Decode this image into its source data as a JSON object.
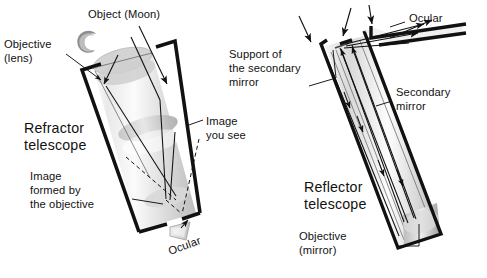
{
  "figure": {
    "title_visible": false,
    "background_color": "#ffffff",
    "ink_color": "#111111",
    "tube_fill_light": "#f2f2f2",
    "tube_fill_mid": "#c9c9c9",
    "tube_fill_dark": "#9a9a9a"
  },
  "refractor": {
    "name_line1": "Refractor",
    "name_line2": "telescope",
    "object_label": "Object (Moon)",
    "objective_line1": "Objective",
    "objective_line2": "(lens)",
    "image_you_see_line1": "Image",
    "image_you_see_line2": "you see",
    "image_formed_line1": "Image",
    "image_formed_line2": "formed by",
    "image_formed_line3": "the objective",
    "ocular_label": "Ocular",
    "moon_icon": "crescent-moon-icon"
  },
  "reflector": {
    "name_line1": "Reflector",
    "name_line2": "telescope",
    "support_line1": "Support of",
    "support_line2": "the secondary",
    "support_line3": "mirror",
    "secondary_line1": "Secondary",
    "secondary_line2": "mirror",
    "ocular_label": "Ocular",
    "objective_line1": "Objective",
    "objective_line2": "(mirror)"
  }
}
